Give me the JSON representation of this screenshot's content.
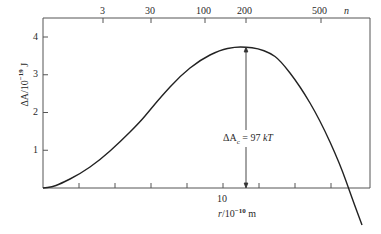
{
  "chart_data": {
    "type": "line",
    "title": "",
    "xlabel": "r/10^-10 m",
    "ylabel": "ΔA/10^-19 J",
    "top_axis_label": "n",
    "xlim": [
      5,
      9.05
    ],
    "ylim": [
      0,
      4.5
    ],
    "x_ticks": [
      6,
      7,
      8,
      9,
      10,
      11,
      12,
      13
    ],
    "x_tick_labels": [
      {
        "value": 10,
        "label": "10"
      }
    ],
    "y_ticks": [
      1,
      2,
      3,
      4
    ],
    "y_tick_labels": [
      "1",
      "2",
      "3",
      "4"
    ],
    "top_ticks": [
      {
        "label": "3",
        "px": 103
      },
      {
        "label": "30",
        "px": 151
      },
      {
        "label": "100",
        "px": 205
      },
      {
        "label": "200",
        "px": 246
      },
      {
        "label": "500",
        "px": 321
      }
    ],
    "grid": false,
    "legend": null,
    "series": [
      {
        "name": "ΔA(r)",
        "points_px": [
          [
            43,
            188
          ],
          [
            52,
            187
          ],
          [
            60,
            184
          ],
          [
            80,
            174
          ],
          [
            100,
            160
          ],
          [
            120,
            142
          ],
          [
            140,
            122
          ],
          [
            150,
            110
          ],
          [
            160,
            98
          ],
          [
            180,
            76
          ],
          [
            200,
            60
          ],
          [
            220,
            50
          ],
          [
            235,
            47
          ],
          [
            246,
            47
          ],
          [
            258,
            48.5
          ],
          [
            270,
            53
          ],
          [
            280,
            60
          ],
          [
            300,
            86
          ],
          [
            320,
            120
          ],
          [
            340,
            164
          ],
          [
            352,
            198
          ],
          [
            362,
            225
          ]
        ],
        "x": [
          5.0,
          5.25,
          5.47,
          6.03,
          6.58,
          7.14,
          7.69,
          7.97,
          8.25,
          8.81,
          9.36,
          9.92,
          10.33,
          10.64,
          10.97,
          11.31,
          11.58,
          12.14,
          12.69,
          13.25,
          13.58,
          13.86
        ],
        "y": [
          0.0,
          0.03,
          0.11,
          0.37,
          0.74,
          1.22,
          1.75,
          2.07,
          2.38,
          2.97,
          3.39,
          3.66,
          3.74,
          3.74,
          3.7,
          3.58,
          3.39,
          2.7,
          1.8,
          0.64,
          -0.26,
          -0.98
        ]
      }
    ],
    "annotations": [
      {
        "text": "ΔAc = 97 kT",
        "type": "double-arrow",
        "x": 10.64,
        "y_from": 0,
        "y_to": 3.74
      }
    ],
    "labels": {
      "y_axis_main": "ΔA/10",
      "y_axis_exp": "−19",
      "y_axis_unit": " J",
      "x_axis_main": "r",
      "x_axis_mid": "/10",
      "x_axis_exp": "−10",
      "x_axis_unit": " m",
      "x_tick_10": "10",
      "top_n": "n",
      "annot_delta": "ΔA",
      "annot_sub": "c",
      "annot_eq": " = 97 ",
      "annot_kT": "kT"
    }
  }
}
